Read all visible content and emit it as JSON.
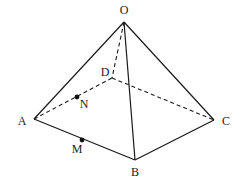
{
  "diagram": {
    "type": "pyramid",
    "vertices": {
      "O": {
        "label": "O",
        "x": 124,
        "y": 22,
        "lx": 124,
        "ly": 14
      },
      "A": {
        "label": "A",
        "x": 34,
        "y": 119,
        "lx": 22,
        "ly": 125
      },
      "B": {
        "label": "B",
        "x": 135,
        "y": 160,
        "lx": 135,
        "ly": 176
      },
      "C": {
        "label": "C",
        "x": 214,
        "y": 120,
        "lx": 226,
        "ly": 125
      },
      "D": {
        "label": "D",
        "x": 112,
        "y": 78,
        "lx": 105,
        "ly": 76
      }
    },
    "points": {
      "N": {
        "label": "N",
        "x": 77,
        "y": 97,
        "lx": 84,
        "ly": 108
      },
      "M": {
        "label": "M",
        "x": 82,
        "y": 140,
        "lx": 77,
        "ly": 153
      }
    },
    "solid_edges": [
      [
        "O",
        "A"
      ],
      [
        "O",
        "B"
      ],
      [
        "O",
        "C"
      ],
      [
        "A",
        "B"
      ],
      [
        "B",
        "C"
      ]
    ],
    "dashed_edges": [
      [
        "O",
        "D"
      ],
      [
        "A",
        "D"
      ],
      [
        "D",
        "C"
      ]
    ]
  }
}
